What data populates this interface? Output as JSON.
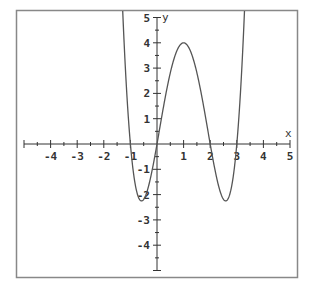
{
  "chart_data": {
    "type": "line",
    "title": "",
    "xlabel": "x",
    "ylabel": "y",
    "xlim": [
      -5,
      5
    ],
    "ylim": [
      -5,
      5
    ],
    "grid": false,
    "legend": null,
    "x_ticks": [
      -4,
      -3,
      -2,
      -1,
      1,
      2,
      3,
      4,
      5
    ],
    "x_tick_labels": [
      "-4",
      "-3",
      "-2",
      "-1",
      "1",
      "2",
      "3",
      "4",
      "5"
    ],
    "y_ticks": [
      5,
      4,
      3,
      2,
      1,
      -1,
      -2,
      -3,
      -4
    ],
    "y_tick_labels": [
      "5",
      "4",
      "3",
      "2",
      "1",
      "-1",
      "-2",
      "-3",
      "-4"
    ],
    "minor_tick_step": 0.5,
    "function": "y = x(x+1)(x-2)(x-3)",
    "roots": [
      -1,
      0,
      2,
      3
    ],
    "local_maximum": {
      "x": 1,
      "y": 4
    },
    "local_minima": [
      {
        "x": -0.6,
        "y": -2.2
      },
      {
        "x": 2.6,
        "y": -2.2
      }
    ],
    "series": [
      {
        "name": "f(x)",
        "x": [
          -1.3,
          -1.2,
          -1.1,
          -1.0,
          -0.9,
          -0.8,
          -0.7,
          -0.6,
          -0.5,
          -0.4,
          -0.3,
          -0.2,
          -0.1,
          0.0,
          0.2,
          0.4,
          0.6,
          0.8,
          1.0,
          1.2,
          1.4,
          1.6,
          1.8,
          2.0,
          2.2,
          2.4,
          2.6,
          2.8,
          2.9,
          3.0,
          3.1,
          3.2,
          3.3
        ],
        "values": [
          6.42,
          4.17,
          1.99,
          0.0,
          -1.02,
          -1.78,
          -2.12,
          -2.25,
          -2.19,
          -1.98,
          -1.65,
          -1.22,
          -0.66,
          0.0,
          1.3,
          2.43,
          3.28,
          3.79,
          4.0,
          3.79,
          3.28,
          2.43,
          1.3,
          0.0,
          -1.22,
          -1.98,
          -2.25,
          -1.78,
          -1.02,
          0.0,
          1.32,
          2.87,
          4.72
        ]
      }
    ],
    "colors": {
      "curve": "#555555",
      "axes": "#333333",
      "frame": "#888888",
      "background": "#ffffff"
    }
  }
}
